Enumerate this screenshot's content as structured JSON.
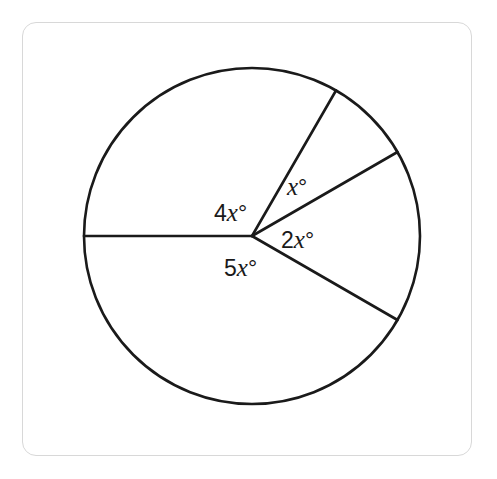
{
  "figure": {
    "type": "circle-sectors",
    "center": [
      252,
      236
    ],
    "radius": 168,
    "stroke_color": "#1a1a1a",
    "frame_border_color": "#d8d8d8",
    "radii_angles_deg": [
      180,
      60,
      30,
      -30
    ],
    "sectors": [
      {
        "id": "sector-4x",
        "coef": "4",
        "var": "x",
        "unit": "°",
        "angle_deg": 120,
        "label_pos": [
          214,
          221
        ]
      },
      {
        "id": "sector-x",
        "coef": "",
        "var": "x",
        "unit": "°",
        "angle_deg": 30,
        "label_pos": [
          287,
          195
        ]
      },
      {
        "id": "sector-2x",
        "coef": "2",
        "var": "x",
        "unit": "°",
        "angle_deg": 60,
        "label_pos": [
          281,
          248
        ]
      },
      {
        "id": "sector-5x",
        "coef": "5",
        "var": "x",
        "unit": "°",
        "angle_deg": 150,
        "label_pos": [
          224,
          276
        ]
      }
    ]
  },
  "labels": {
    "a": {
      "coef": "4",
      "var": "x",
      "unit": "°"
    },
    "b": {
      "coef": "",
      "var": "x",
      "unit": "°"
    },
    "c": {
      "coef": "2",
      "var": "x",
      "unit": "°"
    },
    "d": {
      "coef": "5",
      "var": "x",
      "unit": "°"
    }
  }
}
